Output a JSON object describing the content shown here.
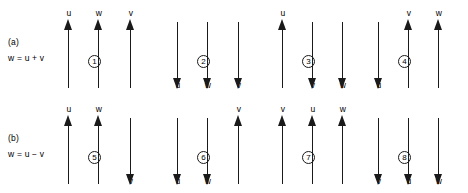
{
  "figure": {
    "width": 468,
    "height": 193,
    "stroke_color": "#1a1a1a",
    "background_color": "#ffffff"
  },
  "rows": [
    {
      "id": "row-a",
      "tag": "(a)",
      "equation": "w = u + v",
      "diagrams": [
        {
          "number": "①",
          "number_plain": "1",
          "num_x": 88,
          "vectors": [
            {
              "label": "u",
              "direction": "up",
              "x": 68
            },
            {
              "label": "w",
              "direction": "up",
              "x": 98
            },
            {
              "label": "v",
              "direction": "up",
              "x": 130
            }
          ]
        },
        {
          "number": "②",
          "number_plain": "2",
          "num_x": 197,
          "vectors": [
            {
              "label": "u",
              "direction": "down",
              "x": 177
            },
            {
              "label": "w",
              "direction": "down",
              "x": 207
            },
            {
              "label": "v",
              "direction": "down",
              "x": 238
            }
          ]
        },
        {
          "number": "③",
          "number_plain": "3",
          "num_x": 302,
          "vectors": [
            {
              "label": "u",
              "direction": "up",
              "x": 282
            },
            {
              "label": "v",
              "direction": "down",
              "x": 312
            },
            {
              "label": "w",
              "direction": "down",
              "x": 342
            }
          ]
        },
        {
          "number": "④",
          "number_plain": "4",
          "num_x": 398,
          "vectors": [
            {
              "label": "u",
              "direction": "down",
              "x": 378
            },
            {
              "label": "v",
              "direction": "up",
              "x": 408
            },
            {
              "label": "w",
              "direction": "up",
              "x": 438
            }
          ]
        }
      ]
    },
    {
      "id": "row-b",
      "tag": "(b)",
      "equation": "w = u − v",
      "diagrams": [
        {
          "number": "⑤",
          "number_plain": "5",
          "num_x": 88,
          "vectors": [
            {
              "label": "u",
              "direction": "up",
              "x": 68
            },
            {
              "label": "w",
              "direction": "up",
              "x": 98
            },
            {
              "label": "v",
              "direction": "down",
              "x": 130
            }
          ]
        },
        {
          "number": "⑥",
          "number_plain": "6",
          "num_x": 197,
          "vectors": [
            {
              "label": "u",
              "direction": "down",
              "x": 177
            },
            {
              "label": "w",
              "direction": "down",
              "x": 207
            },
            {
              "label": "v",
              "direction": "up",
              "x": 238
            }
          ]
        },
        {
          "number": "⑦",
          "number_plain": "7",
          "num_x": 302,
          "vectors": [
            {
              "label": "v",
              "direction": "up",
              "x": 282
            },
            {
              "label": "u",
              "direction": "up",
              "x": 312
            },
            {
              "label": "w",
              "direction": "up",
              "x": 342
            }
          ]
        },
        {
          "number": "⑧",
          "number_plain": "8",
          "num_x": 398,
          "vectors": [
            {
              "label": "v",
              "direction": "down",
              "x": 378
            },
            {
              "label": "u",
              "direction": "down",
              "x": 408
            },
            {
              "label": "w",
              "direction": "down",
              "x": 438
            }
          ]
        }
      ]
    }
  ]
}
